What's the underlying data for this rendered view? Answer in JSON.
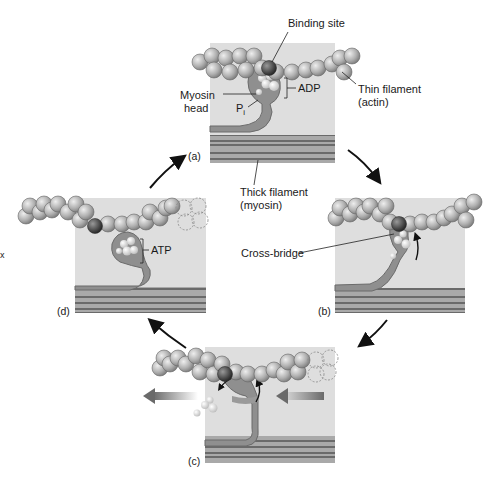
{
  "figure": {
    "panels": [
      {
        "id": "a",
        "label": "(a)"
      },
      {
        "id": "b",
        "label": "(b)"
      },
      {
        "id": "c",
        "label": "(c)"
      },
      {
        "id": "d",
        "label": "(d)"
      }
    ],
    "labels": {
      "binding_site": "Binding site",
      "thin_filament": "Thin filament",
      "thin_filament_sub": "(actin)",
      "myosin_head": "Myosin",
      "myosin_head_sub": "head",
      "adp": "ADP",
      "pi": "P",
      "pi_sub": "i",
      "thick_filament": "Thick filament",
      "thick_filament_sub": "(myosin)",
      "cross_bridge": "Cross-bridge",
      "atp": "ATP",
      "stray_mark": "x"
    },
    "colors": {
      "panel_bg": "#dcdcdc",
      "actin_bead": "#b4b4b4",
      "binding_site_bead": "#555555",
      "myosin": "#8c8c8c",
      "thick_stripe_dark": "#6e6e6e",
      "thick_stripe_light": "#a8a8a8",
      "arrow": "#111111",
      "movement_arrow": "#7a7a7a"
    }
  }
}
